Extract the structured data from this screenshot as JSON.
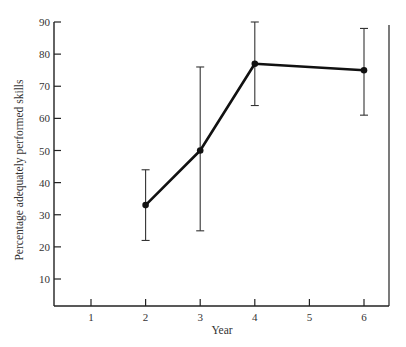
{
  "chart_data": {
    "type": "line",
    "title": "",
    "xlabel": "Year",
    "ylabel": "Percentage adequately performed skills",
    "x_ticks": [
      "1",
      "2",
      "3",
      "4",
      "5",
      "6"
    ],
    "y_ticks": [
      "10",
      "20",
      "30",
      "40",
      "50",
      "60",
      "70",
      "80",
      "90"
    ],
    "xlim": [
      0.3,
      6.15
    ],
    "ylim": [
      0,
      90
    ],
    "grid": false,
    "legend": null,
    "series": [
      {
        "name": "Percentage adequately performed skills",
        "x": [
          2,
          3,
          4,
          6
        ],
        "values": [
          33,
          50,
          77,
          75
        ],
        "error_upper": [
          44,
          76,
          90,
          88
        ],
        "error_lower": [
          22,
          25,
          64,
          61
        ],
        "marker": "circle",
        "color": "#111111"
      }
    ]
  }
}
